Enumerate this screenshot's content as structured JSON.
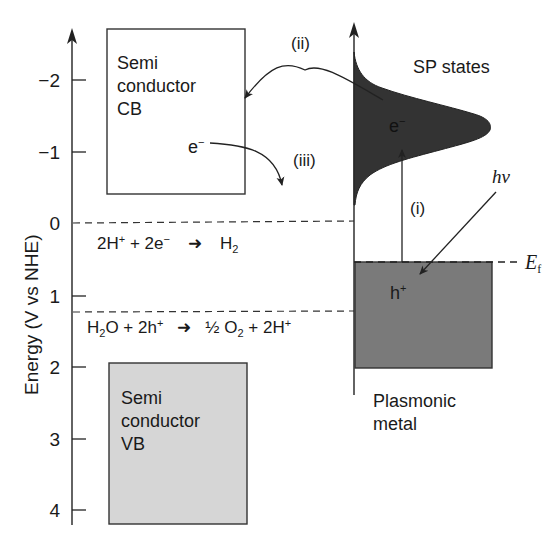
{
  "diagram": {
    "y_axis": {
      "label": "Energy (V vs NHE)",
      "ticks": [
        "−2",
        "−1",
        "0",
        "1",
        "2",
        "3",
        "4"
      ]
    },
    "semiconductor_cb": {
      "line1": "Semi",
      "line2": "conductor",
      "line3": "CB",
      "electron": "e",
      "electron_sup": "−"
    },
    "semiconductor_vb": {
      "line1": "Semi",
      "line2": "conductor",
      "line3": "VB"
    },
    "reactions": {
      "hydrogen": {
        "lhs_a": "2H",
        "lhs_a_sup": "+",
        "plus": " + 2e",
        "plus_sup": "−",
        "rhs": "H",
        "rhs_sub": "2"
      },
      "oxygen": {
        "lhs_a": "H",
        "lhs_a_sub": "2",
        "lhs_b": "O + 2h",
        "lhs_b_sup": "+",
        "rhs_a": "½ O",
        "rhs_a_sub": "2",
        "rhs_b": " + 2H",
        "rhs_b_sup": "+"
      }
    },
    "processes": {
      "i": "(i)",
      "ii": "(ii)",
      "iii": "(iii)"
    },
    "plasmonic": {
      "sp_states": "SP states",
      "electron": "e",
      "electron_sup": "−",
      "hole": "h",
      "hole_sup": "+",
      "photon": "hν",
      "fermi": "E",
      "fermi_sub": "f",
      "metal_line1": "Plasmonic",
      "metal_line2": "metal"
    },
    "colors": {
      "line": "#222222",
      "sp_fill": "#333333",
      "metal_fill": "#7a7a7a",
      "vb_fill": "#d6d6d6",
      "cb_fill": "#ffffff"
    }
  }
}
